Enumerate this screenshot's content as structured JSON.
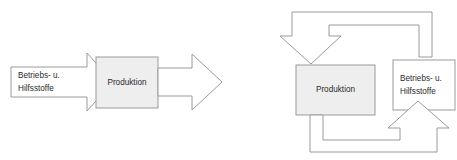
{
  "diagram": {
    "title": "Prozessdiagramm Betriebs- und Hilfsstoffe",
    "background_color": "#ffffff",
    "stroke_color": "#9a9a9a",
    "fill_shaded": "#eeeeee",
    "fill_plain": "#ffffff",
    "text_color": "#2b2b2b"
  },
  "left_diagram": {
    "name": "linearer-materialfluss",
    "input_arrow": {
      "label_line1": "Betriebs- u.",
      "label_line2": "Hilfsstoffe",
      "direction": "right",
      "fill": "#ffffff"
    },
    "process_box": {
      "label": "Produktion",
      "fill": "#eeeeee"
    },
    "output_arrow": {
      "label": "",
      "direction": "right",
      "fill": "#ffffff"
    }
  },
  "right_diagram": {
    "name": "kreislauf-materialfluss",
    "process_box": {
      "label": "Produktion",
      "fill": "#eeeeee"
    },
    "material_box": {
      "label_line1": "Betriebs- u.",
      "label_line2": "Hilfsstoffe",
      "fill": "#ffffff"
    },
    "top_loop_arrow": {
      "label": "",
      "direction": "down",
      "from": "material_box",
      "to": "process_box"
    },
    "bottom_loop_arrow": {
      "label": "",
      "direction": "up",
      "from": "process_box",
      "to": "material_box"
    }
  }
}
